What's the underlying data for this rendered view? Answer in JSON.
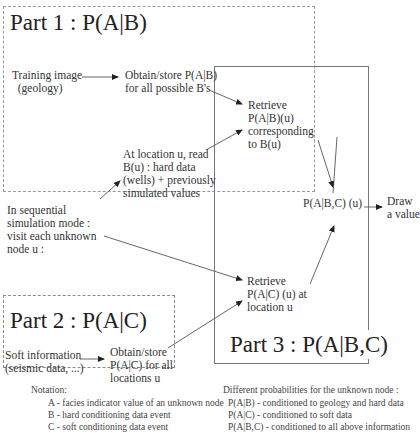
{
  "parts": {
    "part1": {
      "title": "Part 1 : P(A|B)"
    },
    "part2": {
      "title": "Part 2 : P(A|C)"
    },
    "part3": {
      "title": "Part 3 : P(A|B,C)"
    }
  },
  "nodes": {
    "training_image": "Training image\n  (geology)",
    "obtain_pab": "Obtain/store P(A|B)\nfor all possible B's",
    "retrieve_pab": "Retrieve\nP(A|B)(u)\ncorresponding\nto B(u)",
    "read_bu": "At location u, read\nB(u) : hard data\n(wells) + previously\nsimulated values",
    "sequential": "In sequential\nsimulation mode :\nvisit each unknown\nnode u :",
    "pabc": "P(A|B,C) (u)",
    "draw": "Draw\na value",
    "retrieve_pac": "Retrieve\nP(A|C) (u) at\nlocation u",
    "soft_info": "Soft information\n(seismic data, ...)",
    "obtain_pac": "Obtain/store\nP(A|C) for all\nlocations u"
  },
  "notation": {
    "heading": "Notation:",
    "items": [
      "A - facies indicator value of an unknown node",
      "B - hard conditioning data event",
      "C - soft conditioning data event"
    ]
  },
  "probabilities": {
    "heading": "Different probabilities for the unknown node :",
    "items": [
      "P(A|B) - conditioned to geology and hard data",
      "P(A|C) - conditioned to soft data",
      "P(A|B,C) - conditioned to all above information"
    ]
  }
}
